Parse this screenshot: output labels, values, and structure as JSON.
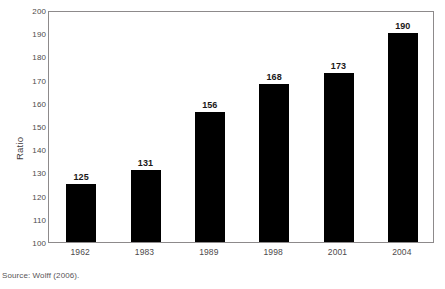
{
  "chart_data": {
    "type": "bar",
    "title": "",
    "xlabel": "",
    "ylabel": "Ratio",
    "categories": [
      "1962",
      "1983",
      "1989",
      "1998",
      "2001",
      "2004"
    ],
    "values": [
      125,
      131,
      156,
      168,
      173,
      190
    ],
    "value_labels": [
      "125",
      "131",
      "156",
      "168",
      "173",
      "190"
    ],
    "ylim": [
      100,
      200
    ],
    "ytick_values": [
      100,
      110,
      120,
      130,
      140,
      150,
      160,
      170,
      180,
      190,
      200
    ],
    "ytick_labels": [
      "100",
      "110",
      "120",
      "130",
      "140",
      "150",
      "160",
      "170",
      "180",
      "190",
      "200"
    ],
    "grid": false,
    "legend": false,
    "bar_color": "#000000",
    "plot_border_color": "#8d8a8b",
    "background_color": "#ffffff"
  },
  "source": {
    "text": "Source: Wolff (2006)."
  }
}
